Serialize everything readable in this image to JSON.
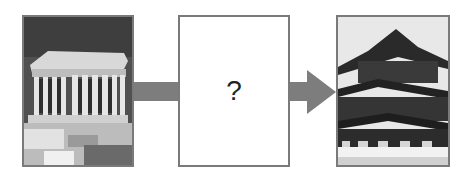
{
  "diagram": {
    "left_image": {
      "label": "Greek temple (Parthenon) photo",
      "icon": "classical-temple-photo"
    },
    "center_box": {
      "text": "?"
    },
    "right_image": {
      "label": "Japanese pagoda-style temple photo",
      "icon": "pagoda-photo"
    },
    "connector": {
      "color": "#7d7d7d",
      "direction": "left-to-right"
    },
    "colors": {
      "border": "#7a7a7a",
      "arrow": "#7d7d7d",
      "background": "#ffffff"
    }
  }
}
